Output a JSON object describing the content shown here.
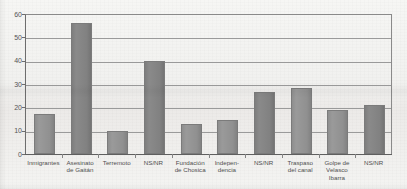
{
  "chart_data": {
    "type": "bar",
    "title": "",
    "xlabel": "",
    "ylabel": "",
    "ylim": [
      0,
      60
    ],
    "yticks": [
      0,
      10,
      20,
      30,
      40,
      50,
      60
    ],
    "grid": true,
    "legend": "none",
    "bar_color": "#8f8f8f",
    "categories": [
      "Inmigrantes",
      "Asesinato de Gaitán",
      "Terremoto",
      "NS/NR",
      "Fundación de Chosica",
      "Independencia",
      "NS/NR",
      "Traspaso del canal",
      "Golpe de Velasco Ibarra",
      "NS/NR"
    ],
    "category_lines": [
      [
        "Inmigrantes"
      ],
      [
        "Asesinato",
        "de Gaitán"
      ],
      [
        "Terremoto"
      ],
      [
        "NS/NR"
      ],
      [
        "Fundación",
        "de Chosica"
      ],
      [
        "Indepen-",
        "dencia"
      ],
      [
        "NS/NR"
      ],
      [
        "Traspaso",
        "del canal"
      ],
      [
        "Golpe de",
        "Velasco",
        "Ibarra"
      ],
      [
        "NS/NR"
      ]
    ],
    "values": [
      17,
      56,
      10,
      40,
      13,
      14.5,
      26.5,
      28.5,
      19,
      21
    ]
  }
}
